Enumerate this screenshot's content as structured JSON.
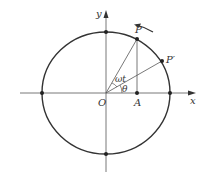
{
  "diagram": {
    "type": "unit-circle-rotation",
    "labels": {
      "y_axis": "y",
      "x_axis": "x",
      "origin": "O",
      "point_p": "P",
      "point_p_prime": "P′",
      "point_a": "A",
      "angle_omega_t": "ωt",
      "angle_theta": "θ"
    },
    "colors": {
      "stroke": "#333333",
      "axis": "#555555",
      "background": "#ffffff"
    }
  }
}
